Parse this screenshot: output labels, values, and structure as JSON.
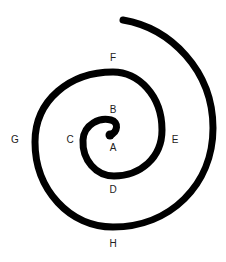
{
  "diagram": {
    "type": "spiral",
    "stroke_color": "#000000",
    "background": "#ffffff",
    "direction": "clockwise-outward",
    "labels": [
      {
        "id": "A",
        "text": "A",
        "position": "center"
      },
      {
        "id": "B",
        "text": "B",
        "position": "above-center"
      },
      {
        "id": "C",
        "text": "C",
        "position": "left-inner"
      },
      {
        "id": "D",
        "text": "D",
        "position": "below-inner"
      },
      {
        "id": "E",
        "text": "E",
        "position": "right-middle"
      },
      {
        "id": "F",
        "text": "F",
        "position": "top-middle"
      },
      {
        "id": "G",
        "text": "G",
        "position": "left-outer"
      },
      {
        "id": "H",
        "text": "H",
        "position": "bottom-outer"
      }
    ]
  }
}
